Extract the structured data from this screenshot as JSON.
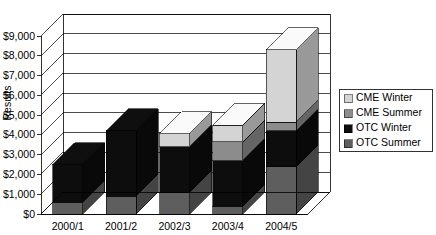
{
  "chart_data": {
    "type": "bar",
    "subtype": "stacked-column-3d",
    "title": "",
    "xlabel": "",
    "ylabel": "Results",
    "categories": [
      "2000/1",
      "2001/2",
      "2002/3",
      "2003/4",
      "2004/5"
    ],
    "ylim": [
      0,
      9000
    ],
    "ytick_step": 1000,
    "ytick_labels": [
      "$0",
      "$1,000",
      "$2,000",
      "$3,000",
      "$4,000",
      "$5,000",
      "$6,000",
      "$7,000",
      "$8,000",
      "$9,000"
    ],
    "ytick_values": [
      0,
      1000,
      2000,
      3000,
      4000,
      5000,
      6000,
      7000,
      8000,
      9000
    ],
    "grid": true,
    "grid_axis": "y",
    "legend_position": "right",
    "stack_order": [
      "OTC Summer",
      "OTC Winter",
      "CME Summer",
      "CME Winter"
    ],
    "series": [
      {
        "name": "OTC Summer",
        "color": "#5e5e5e",
        "values": [
          600,
          900,
          1100,
          400,
          2400
        ]
      },
      {
        "name": "OTC Winter",
        "color": "#0d0d0d",
        "values": [
          1900,
          3300,
          2300,
          2300,
          1800
        ]
      },
      {
        "name": "CME Summer",
        "color": "#8c8c8c",
        "values": [
          0,
          0,
          0,
          950,
          450
        ]
      },
      {
        "name": "CME Winter",
        "color": "#d4d4d4",
        "values": [
          0,
          0,
          650,
          850,
          3650
        ]
      }
    ],
    "totals": [
      2500,
      4200,
      4050,
      4500,
      8300
    ]
  },
  "legend": {
    "items": [
      {
        "label": "CME Winter",
        "swatch_name": "legend-swatch-cme-winter",
        "color": "#d4d4d4"
      },
      {
        "label": "CME Summer",
        "swatch_name": "legend-swatch-cme-summer",
        "color": "#8c8c8c"
      },
      {
        "label": "OTC Winter",
        "swatch_name": "legend-swatch-otc-winter",
        "color": "#0d0d0d"
      },
      {
        "label": "OTC Summer",
        "swatch_name": "legend-swatch-otc-summer",
        "color": "#5e5e5e"
      }
    ]
  },
  "colors": {
    "cme_winter": "#d4d4d4",
    "cme_summer": "#8c8c8c",
    "otc_winter": "#0d0d0d",
    "otc_summer": "#5e5e5e",
    "plot_background": "#ffffff",
    "wall_side": "#ffffff",
    "axis": "#000000"
  }
}
